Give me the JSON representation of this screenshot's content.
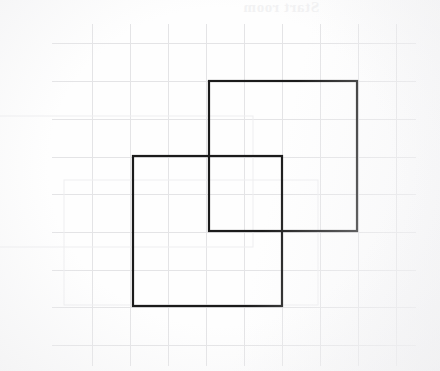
{
  "document": {
    "kind": "graph-paper-worksheet-scan",
    "width": 440,
    "height": 371,
    "background_color": "#ffffff",
    "watermark_text": "Start room",
    "watermark_color": "#f2f2f3",
    "watermark_mirrored": true
  },
  "grid": {
    "label": "graph paper grid",
    "line_color": "#e4e4e6",
    "line_width": 1,
    "cell_size": 38,
    "x_lines": [
      92,
      130,
      168,
      206,
      244,
      282,
      320,
      358,
      396
    ],
    "y_lines": [
      43,
      81,
      119,
      157,
      194,
      232,
      270,
      307,
      345
    ],
    "x_extent": [
      52,
      416
    ],
    "y_extent": [
      24,
      366
    ]
  },
  "shapes": {
    "ink_color": "#1b1b1b",
    "ink_width": 2.2,
    "items": [
      {
        "name": "upper-right-square",
        "type": "square",
        "x": 209,
        "y": 81,
        "width": 148,
        "height": 150,
        "grid_cells": 4
      },
      {
        "name": "lower-left-square",
        "type": "square",
        "x": 133,
        "y": 156,
        "width": 149,
        "height": 150,
        "grid_cells": 4
      }
    ],
    "overlap_region": {
      "name": "overlap-rectangle",
      "x": 209,
      "y": 156,
      "width": 73,
      "height": 75
    }
  },
  "ghosts": {
    "label": "bleed-through shapes from reverse side",
    "line_color": "#eeeef0",
    "line_width": 1,
    "items": [
      {
        "name": "ghost-rectangle-upper-left",
        "x": -58,
        "y": 116,
        "width": 311,
        "height": 131
      },
      {
        "name": "ghost-rectangle-lower",
        "x": 64,
        "y": 180,
        "width": 254,
        "height": 125
      }
    ]
  }
}
